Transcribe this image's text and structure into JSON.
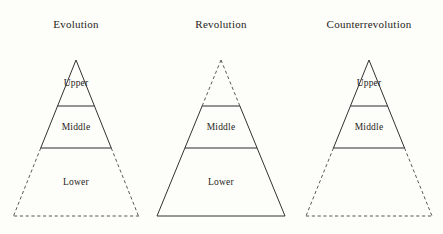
{
  "figure": {
    "background_color": "#fdfdfa",
    "ink_color": "#2e2c2a",
    "dashed_color": "#5a5854",
    "width": 443,
    "height": 234
  },
  "chart_data": {
    "type": "diagram",
    "title": "",
    "subtitle": "",
    "xlabel": "",
    "ylabel": "",
    "legend_position": "none",
    "grid": false,
    "diagram_kind": "stratification-pyramids",
    "shared_tiers": [
      "Upper",
      "Middle",
      "Lower"
    ],
    "tier_boundaries_y": [
      60,
      106,
      148,
      216
    ],
    "panels": [
      {
        "name": "evolution",
        "title": "Evolution",
        "apex_x": 76,
        "base_left_x": 14,
        "base_right_x": 139,
        "tiers": [
          {
            "key": "upper",
            "label": "Upper",
            "label_visible": true,
            "style": "solid"
          },
          {
            "key": "middle",
            "label": "Middle",
            "label_visible": true,
            "style": "solid"
          },
          {
            "key": "lower",
            "label": "Lower",
            "label_visible": true,
            "style": "dashed"
          }
        ]
      },
      {
        "name": "revolution",
        "title": "Revolution",
        "apex_x": 221,
        "base_left_x": 157,
        "base_right_x": 285,
        "tiers": [
          {
            "key": "upper",
            "label": "Upper",
            "label_visible": false,
            "style": "dashed"
          },
          {
            "key": "middle",
            "label": "Middle",
            "label_visible": true,
            "style": "solid"
          },
          {
            "key": "lower",
            "label": "Lower",
            "label_visible": true,
            "style": "solid"
          }
        ]
      },
      {
        "name": "counterrevolution",
        "title": "Counterrevolution",
        "apex_x": 369,
        "base_left_x": 306,
        "base_right_x": 432,
        "tiers": [
          {
            "key": "upper",
            "label": "Upper",
            "label_visible": true,
            "style": "solid"
          },
          {
            "key": "middle",
            "label": "Middle",
            "label_visible": true,
            "style": "solid"
          },
          {
            "key": "lower",
            "label": "Lower",
            "label_visible": false,
            "style": "dashed"
          }
        ]
      }
    ]
  }
}
